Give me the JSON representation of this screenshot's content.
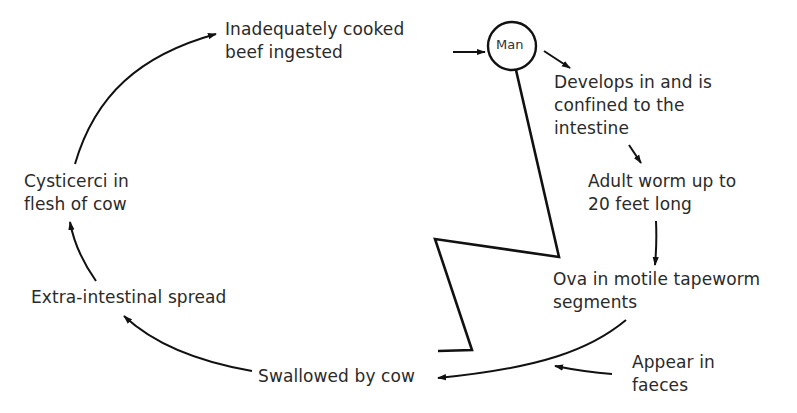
{
  "diagram": {
    "host_node": {
      "label": "Man"
    },
    "stages": [
      {
        "id": "ingested",
        "lines": [
          "Inadequately cooked",
          "beef ingested"
        ]
      },
      {
        "id": "develops",
        "lines": [
          "Develops in and is",
          "confined to the",
          "intestine"
        ]
      },
      {
        "id": "adult",
        "lines": [
          "Adult worm up to",
          "20 feet long"
        ]
      },
      {
        "id": "ova",
        "lines": [
          "Ova in motile tapeworm",
          "segments"
        ]
      },
      {
        "id": "faeces",
        "lines": [
          "Appear in",
          "faeces"
        ]
      },
      {
        "id": "swallowed",
        "lines": [
          "Swallowed by cow"
        ]
      },
      {
        "id": "spread",
        "lines": [
          "Extra-intestinal spread"
        ]
      },
      {
        "id": "cysticerci",
        "lines": [
          "Cysticerci in",
          "flesh of cow"
        ]
      }
    ],
    "edges": [
      {
        "from": "ingested",
        "to": "Man"
      },
      {
        "from": "Man",
        "to": "develops"
      },
      {
        "from": "develops",
        "to": "adult"
      },
      {
        "from": "adult",
        "to": "ova"
      },
      {
        "from": "ova",
        "to": "swallowed"
      },
      {
        "from": "faeces",
        "to": "ova-to-swallowed-curve"
      },
      {
        "from": "swallowed",
        "to": "spread"
      },
      {
        "from": "spread",
        "to": "cysticerci"
      },
      {
        "from": "cysticerci",
        "to": "ingested"
      }
    ],
    "colors": {
      "ink": "#111111",
      "text": "#2a2a2a",
      "background": "#ffffff"
    }
  }
}
